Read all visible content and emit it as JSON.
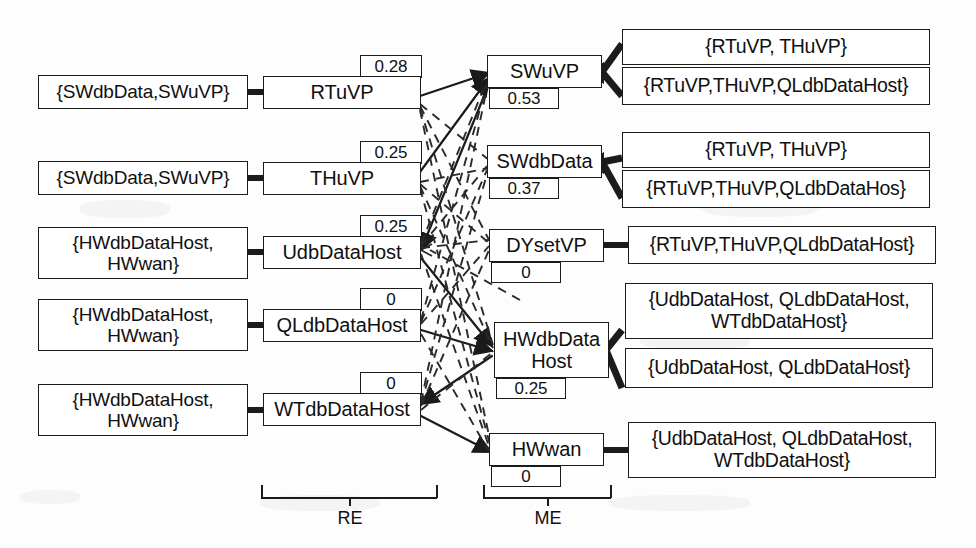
{
  "diagram": {
    "group_labels": {
      "re": "RE",
      "me": "ME"
    },
    "re_nodes": [
      {
        "id": "rtuvp",
        "label": "RTuVP",
        "value": "0.28",
        "precondition": "{SWdbData,SWuVP}"
      },
      {
        "id": "thuvp",
        "label": "THuVP",
        "value": "0.25",
        "precondition": "{SWdbData,SWuVP}"
      },
      {
        "id": "udbdatahost",
        "label": "UdbDataHost",
        "value": "0.25",
        "precondition": "{HWdbDataHost, HWwan}"
      },
      {
        "id": "qldbdatahost",
        "label": "QLdbDataHost",
        "value": "0",
        "precondition": "{HWdbDataHost, HWwan}"
      },
      {
        "id": "wtdbdatahost",
        "label": "WTdbDataHost",
        "value": "0",
        "precondition": "{HWdbDataHost, HWwan}"
      }
    ],
    "me_nodes": [
      {
        "id": "swuvp",
        "label": "SWuVP",
        "value": "0.53",
        "effects": [
          "{RTuVP, THuVP}",
          "{RTuVP,THuVP,QLdbDataHost}"
        ]
      },
      {
        "id": "swdbdata",
        "label": "SWdbData",
        "value": "0.37",
        "effects": [
          "{RTuVP, THuVP}",
          "{RTuVP,THuVP,QLdbDataHos}"
        ]
      },
      {
        "id": "dysetvp",
        "label": "DYsetVP",
        "value": "0",
        "effects": [
          "{RTuVP,THuVP,QLdbDataHost}"
        ]
      },
      {
        "id": "hwdbdatahost",
        "label": "HWdbData Host",
        "value": "0.25",
        "effects": [
          "{UdbDataHost, QLdbDataHost, WTdbDataHost}",
          "{UdbDataHost, QLdbDataHost}"
        ]
      },
      {
        "id": "hwwan",
        "label": "HWwan",
        "value": "0",
        "effects": [
          "{UdbDataHost, QLdbDataHost, WTdbDataHost}"
        ]
      }
    ],
    "colors": {
      "stroke": "#1b1b1b",
      "background": "#fdfdfd",
      "text": "#101010"
    }
  }
}
